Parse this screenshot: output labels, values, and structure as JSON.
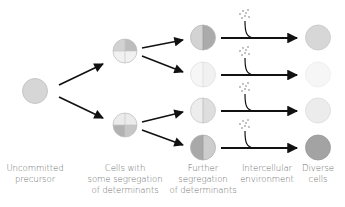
{
  "colors": {
    "precursor": "#d6d6d6",
    "light": "#f0f0f0",
    "mid": "#d3d3d3",
    "dark": "#a8a8a8",
    "outline": "#b8b8b8",
    "arrow": "#111111",
    "text": "#6f6f6f"
  },
  "stages": [
    {
      "id": "precursor",
      "label_lines": [
        "Uncommitted",
        "precursor"
      ]
    },
    {
      "id": "partial-segregation",
      "label_lines": [
        "Cells with",
        "some segregation",
        "of determinants"
      ]
    },
    {
      "id": "further-segregation",
      "label_lines": [
        "Further",
        "segregation",
        "of determinants"
      ]
    },
    {
      "id": "environment",
      "label_lines": [
        "Intercellular",
        "environment"
      ]
    },
    {
      "id": "diverse",
      "label_lines": [
        "Diverse",
        "cells"
      ]
    }
  ],
  "labels": {
    "precursor_1": "Uncommitted",
    "precursor_2": "precursor",
    "stage2_1": "Cells with",
    "stage2_2": "some segregation",
    "stage2_3": "of determinants",
    "stage3_1": "Further",
    "stage3_2": "segregation",
    "stage3_3": "of determinants",
    "env_1": "Intercellular",
    "env_2": "environment",
    "diverse_1": "Diverse",
    "diverse_2": "cells"
  },
  "cells": {
    "precursor": {
      "fill": "#d6d6d6"
    },
    "stage2": [
      {
        "top": "#cfcfcf",
        "top_right": "#bdbdbd",
        "bottom": "#f2f2f2"
      },
      {
        "top": "#ececec",
        "bottom": "#c4c4c4",
        "bottom_left": "#b0b0b0"
      }
    ],
    "stage3": [
      {
        "left": "#d4d4d4",
        "right": "#ababab"
      },
      {
        "left": "#f6f6f6",
        "right": "#f0f0f0"
      },
      {
        "left": "#eeeeee",
        "right": "#dedede"
      },
      {
        "left": "#a9a9a9",
        "right": "#cdcdcd"
      }
    ],
    "final": [
      "#d7d7d7",
      "#f6f6f6",
      "#ececec",
      "#a3a3a3"
    ]
  }
}
